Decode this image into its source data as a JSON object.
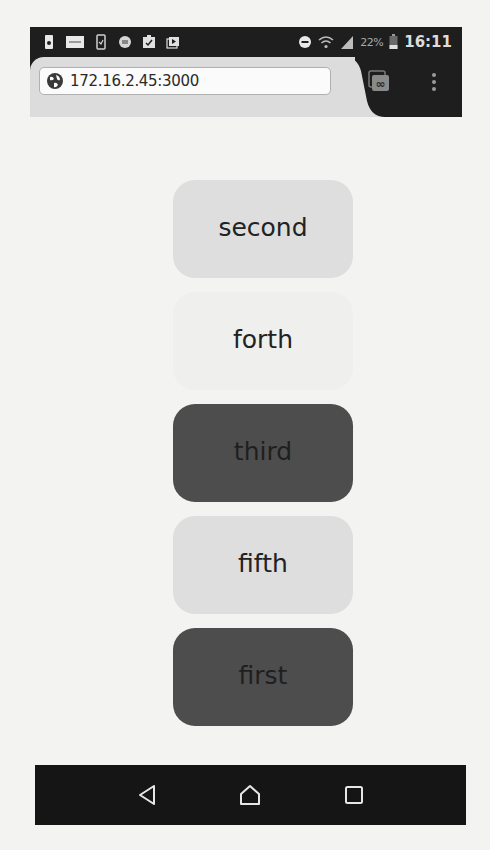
{
  "status_bar": {
    "left_icons": [
      "battery-saver-icon",
      "notification-app-icon",
      "phone-check-icon",
      "shield-app-icon",
      "clipboard-check-icon",
      "media-player-icon"
    ],
    "right_icons": [
      "do-not-disturb-icon",
      "wifi-icon",
      "cell-signal-icon",
      "battery-icon"
    ],
    "battery_percent": "22%",
    "time": "16:11"
  },
  "browser": {
    "url": "172.16.2.45:3000",
    "tabs_button_glyph": "∞",
    "menu_icon": "overflow-menu-icon"
  },
  "cards": [
    {
      "label": "second",
      "style": "light",
      "color": "#dedede"
    },
    {
      "label": "forth",
      "style": "faint",
      "color": "#efefee"
    },
    {
      "label": "third",
      "style": "dark",
      "color": "#4d4d4d"
    },
    {
      "label": "fifth",
      "style": "light",
      "color": "#dedede"
    },
    {
      "label": "first",
      "style": "dark",
      "color": "#4d4d4d"
    }
  ],
  "nav_bar": {
    "buttons": [
      "back-icon",
      "home-icon",
      "recents-icon"
    ]
  }
}
